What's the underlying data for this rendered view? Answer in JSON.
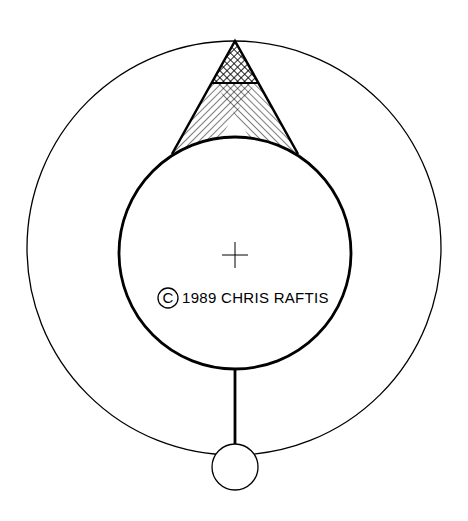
{
  "drawing": {
    "copyright_symbol": "C",
    "caption": "1989 CHRIS RAFTIS",
    "colors": {
      "ink": "#000000",
      "background": "#ffffff"
    }
  },
  "shapes": {
    "outer_circle": {
      "cx": 234,
      "cy": 248,
      "r": 207
    },
    "inner_circle": {
      "cx": 235,
      "cy": 253,
      "r": 116
    },
    "triangle": {
      "apex": [
        235,
        41
      ],
      "base_left": [
        172,
        154
      ],
      "base_right": [
        298,
        154
      ],
      "crossbar_y": 83
    },
    "stem": {
      "x": 235,
      "y1": 369,
      "y2": 447
    },
    "small_circle": {
      "cx": 235,
      "cy": 467,
      "r": 23
    },
    "crosshair": {
      "cx": 235,
      "cy": 255,
      "size": 13
    }
  }
}
